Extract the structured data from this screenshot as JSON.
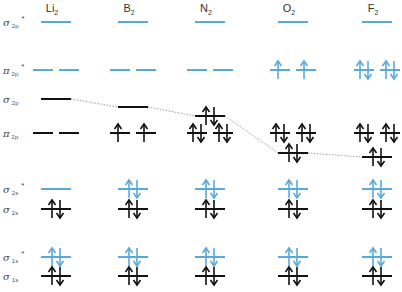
{
  "colors": {
    "antibonding": "#5aa9dd",
    "bonding": "#111111",
    "connector": "#888888",
    "text": "#333333"
  },
  "molecules": [
    {
      "id": "li2",
      "label": "Li",
      "subscript": "2",
      "center_x": 56
    },
    {
      "id": "b2",
      "label": "B",
      "subscript": "2",
      "center_x": 133
    },
    {
      "id": "n2",
      "label": "N",
      "subscript": "2",
      "center_x": 210
    },
    {
      "id": "o2",
      "label": "O",
      "subscript": "2",
      "center_x": 293
    },
    {
      "id": "f2",
      "label": "F",
      "subscript": "2",
      "center_x": 377
    }
  ],
  "row_labels": [
    {
      "id": "sigma2p_star",
      "symbol": "σ",
      "subscript": "2p",
      "star": "*",
      "y": 22
    },
    {
      "id": "pi2p_star",
      "symbol": "π",
      "subscript": "2p",
      "star": "*",
      "y": 70
    },
    {
      "id": "sigma2p",
      "symbol": "σ",
      "subscript": "2p",
      "star": "",
      "y": 99
    },
    {
      "id": "pi2p",
      "symbol": "π",
      "subscript": "2p",
      "star": "",
      "y": 133
    },
    {
      "id": "sigma2s_star",
      "symbol": "σ",
      "subscript": "2s",
      "star": "*",
      "y": 189
    },
    {
      "id": "sigma2s",
      "symbol": "σ",
      "subscript": "2s",
      "star": "",
      "y": 209
    },
    {
      "id": "sigma1s_star",
      "symbol": "σ",
      "subscript": "1s",
      "star": "*",
      "y": 257
    },
    {
      "id": "sigma1s",
      "symbol": "σ",
      "subscript": "1s",
      "star": "",
      "y": 276
    }
  ],
  "orbital_levels": {
    "li2": {
      "sigma2p_star": {
        "y": 22,
        "electrons": [
          0
        ]
      },
      "pi2p_star": {
        "y": 70,
        "electrons": [
          0,
          0
        ]
      },
      "sigma2p": {
        "y": 99,
        "electrons": [
          0
        ]
      },
      "pi2p": {
        "y": 133,
        "electrons": [
          0,
          0
        ]
      },
      "sigma2s_star": {
        "y": 189,
        "electrons": [
          0
        ]
      },
      "sigma2s": {
        "y": 209,
        "electrons": [
          2
        ]
      },
      "sigma1s_star": {
        "y": 257,
        "electrons": [
          2
        ]
      },
      "sigma1s": {
        "y": 276,
        "electrons": [
          2
        ]
      }
    },
    "b2": {
      "sigma2p_star": {
        "y": 22,
        "electrons": [
          0
        ]
      },
      "pi2p_star": {
        "y": 70,
        "electrons": [
          0,
          0
        ]
      },
      "sigma2p": {
        "y": 107,
        "electrons": [
          0
        ]
      },
      "pi2p": {
        "y": 133,
        "electrons": [
          1,
          1
        ]
      },
      "sigma2s_star": {
        "y": 189,
        "electrons": [
          2
        ]
      },
      "sigma2s": {
        "y": 209,
        "electrons": [
          2
        ]
      },
      "sigma1s_star": {
        "y": 257,
        "electrons": [
          2
        ]
      },
      "sigma1s": {
        "y": 276,
        "electrons": [
          2
        ]
      }
    },
    "n2": {
      "sigma2p_star": {
        "y": 22,
        "electrons": [
          0
        ]
      },
      "pi2p_star": {
        "y": 70,
        "electrons": [
          0,
          0
        ]
      },
      "sigma2p": {
        "y": 116,
        "electrons": [
          2
        ]
      },
      "pi2p": {
        "y": 133,
        "electrons": [
          2,
          2
        ]
      },
      "sigma2s_star": {
        "y": 189,
        "electrons": [
          2
        ]
      },
      "sigma2s": {
        "y": 209,
        "electrons": [
          2
        ]
      },
      "sigma1s_star": {
        "y": 257,
        "electrons": [
          2
        ]
      },
      "sigma1s": {
        "y": 276,
        "electrons": [
          2
        ]
      }
    },
    "o2": {
      "sigma2p_star": {
        "y": 22,
        "electrons": [
          0
        ]
      },
      "pi2p_star": {
        "y": 70,
        "electrons": [
          1,
          1
        ]
      },
      "sigma2p": {
        "y": 153,
        "electrons": [
          2
        ]
      },
      "pi2p": {
        "y": 133,
        "electrons": [
          2,
          2
        ]
      },
      "sigma2s_star": {
        "y": 189,
        "electrons": [
          2
        ]
      },
      "sigma2s": {
        "y": 209,
        "electrons": [
          2
        ]
      },
      "sigma1s_star": {
        "y": 257,
        "electrons": [
          2
        ]
      },
      "sigma1s": {
        "y": 276,
        "electrons": [
          2
        ]
      }
    },
    "f2": {
      "sigma2p_star": {
        "y": 22,
        "electrons": [
          0
        ]
      },
      "pi2p_star": {
        "y": 70,
        "electrons": [
          2,
          2
        ]
      },
      "sigma2p": {
        "y": 157,
        "electrons": [
          2
        ]
      },
      "pi2p": {
        "y": 133,
        "electrons": [
          2,
          2
        ]
      },
      "sigma2s_star": {
        "y": 189,
        "electrons": [
          2
        ]
      },
      "sigma2s": {
        "y": 209,
        "electrons": [
          2
        ]
      },
      "sigma1s_star": {
        "y": 257,
        "electrons": [
          2
        ]
      },
      "sigma1s": {
        "y": 276,
        "electrons": [
          2
        ]
      }
    }
  },
  "antibonding_orbitals": [
    "sigma2p_star",
    "pi2p_star",
    "sigma2s_star",
    "sigma1s_star"
  ],
  "degenerate_orbitals": [
    "pi2p_star",
    "pi2p"
  ],
  "sigma2p_connector": "dotted line linking σ2p levels across Li2 → B2 → N2 → O2 → F2"
}
